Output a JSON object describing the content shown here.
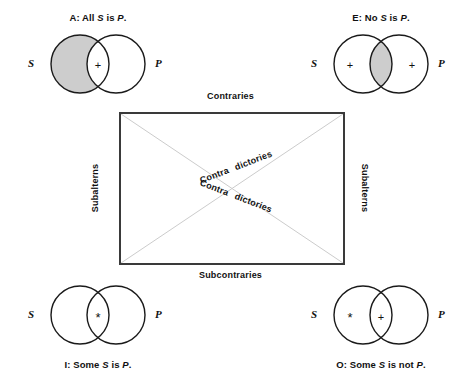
{
  "figure": {
    "background_color": "#ffffff",
    "line_color": "#1a1a1a",
    "box_border_color": "#3a3a3a",
    "diagonal_color": "#cccccc",
    "shading_color": "#cdcdcd"
  },
  "square": {
    "top_label": "Contraries",
    "bottom_label": "Subcontraries",
    "left_label": "Subalterns",
    "right_label": "Subalterns",
    "diagonal_upper": {
      "part1": "Contra",
      "part2": "dictories"
    },
    "diagonal_lower": {
      "part1": "Contra",
      "part2": "dictories"
    }
  },
  "venns": [
    {
      "id": "A",
      "position": "top-left",
      "caption_prefix": "A:",
      "caption_text_1": "All",
      "caption_subject": "S",
      "caption_text_2": "is",
      "caption_predicate": "P",
      "caption_text_3": ".",
      "left_circle_label": "S",
      "right_circle_label": "P",
      "marks": {
        "s_only": "",
        "intersection": "+",
        "p_only": ""
      },
      "shaded_region": "s-only"
    },
    {
      "id": "E",
      "position": "top-right",
      "caption_prefix": "E:",
      "caption_text_1": "No",
      "caption_subject": "S",
      "caption_text_2": "is",
      "caption_predicate": "P",
      "caption_text_3": ".",
      "left_circle_label": "S",
      "right_circle_label": "P",
      "marks": {
        "s_only": "+",
        "intersection": "",
        "p_only": "+"
      },
      "shaded_region": "intersection"
    },
    {
      "id": "I",
      "position": "bottom-left",
      "caption_prefix": "I:",
      "caption_text_1": "Some",
      "caption_subject": "S",
      "caption_text_2": "is",
      "caption_predicate": "P",
      "caption_text_3": ".",
      "left_circle_label": "S",
      "right_circle_label": "P",
      "marks": {
        "s_only": "",
        "intersection": "*",
        "p_only": ""
      },
      "shaded_region": "none"
    },
    {
      "id": "O",
      "position": "bottom-right",
      "caption_prefix": "O:",
      "caption_text_1": "Some",
      "caption_subject": "S",
      "caption_text_2": "is not",
      "caption_predicate": "P",
      "caption_text_3": ".",
      "left_circle_label": "S",
      "right_circle_label": "P",
      "marks": {
        "s_only": "*",
        "intersection": "+",
        "p_only": ""
      },
      "shaded_region": "none"
    }
  ]
}
